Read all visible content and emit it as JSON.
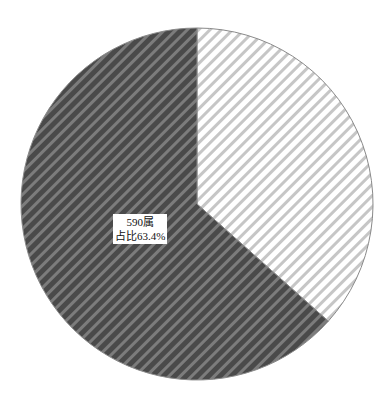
{
  "chart_data": {
    "type": "pie",
    "title": "",
    "slices": [
      {
        "name": "590属",
        "value": 63.4,
        "count": 590,
        "label_line1": "590属",
        "label_line2": "占比63.4%",
        "fill": "#4a4a4a",
        "stripe": "#7c7c7c",
        "pattern": "diagonal-hatch-dark"
      },
      {
        "name": "other",
        "value": 36.6,
        "label_line1": "",
        "label_line2": "",
        "fill": "#ffffff",
        "stripe": "#c4c4c4",
        "pattern": "diagonal-hatch-light"
      }
    ],
    "start_angle_deg": 0,
    "direction": "clockwise-from-light",
    "legend": "none"
  },
  "labels": {
    "dark_line1": "590属",
    "dark_line2": "占比63.4%"
  }
}
